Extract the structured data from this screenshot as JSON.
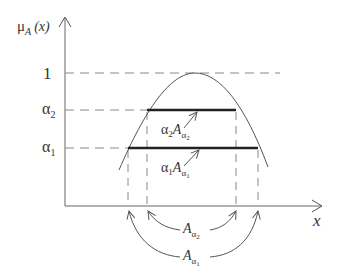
{
  "diagram": {
    "y_axis": {
      "label_mu": "μ",
      "label_sub": "A",
      "label_arg": "(x)"
    },
    "x_axis": {
      "label": "x"
    },
    "levels": [
      {
        "name": "one",
        "label": "1"
      },
      {
        "name": "alpha2",
        "label_base": "α",
        "label_sub": "2"
      },
      {
        "name": "alpha1",
        "label_base": "α",
        "label_sub": "1"
      }
    ],
    "annotations": {
      "a2_scaled": {
        "alpha": "α",
        "alpha_sub": "2",
        "set": "A",
        "set_sub": "α",
        "set_subsub": "2"
      },
      "a1_scaled": {
        "alpha": "α",
        "alpha_sub": "1",
        "set": "A",
        "set_sub": "α",
        "set_subsub": "1"
      },
      "a2_cut": {
        "set": "A",
        "set_sub": "α",
        "set_subsub": "2"
      },
      "a1_cut": {
        "set": "A",
        "set_sub": "α",
        "set_subsub": "1"
      }
    },
    "colors": {
      "stroke": "#555555",
      "bar": "#222222",
      "dash": "#888888"
    }
  }
}
